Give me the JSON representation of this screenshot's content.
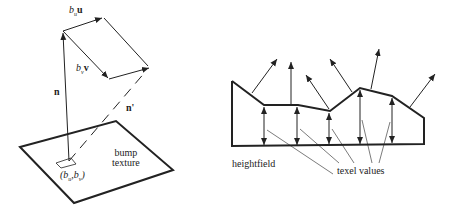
{
  "left_diagram": {
    "labels": {
      "bu_u_prefix": "b",
      "bu_u_sub": "u",
      "bu_u_vec": "u",
      "bv_v_prefix": "b",
      "bv_v_sub": "v",
      "bv_v_vec": "v",
      "normal": "n",
      "perturbed_normal": "n'",
      "bump_line1": "bump",
      "bump_line2": "texture",
      "coord": "(b",
      "coord_sub1": "u",
      "coord_mid": ",b",
      "coord_sub2": "v",
      "coord_end": ")"
    }
  },
  "right_diagram": {
    "labels": {
      "heightfield": "heightfield",
      "texel_values": "texel values"
    }
  },
  "colors": {
    "stroke": "#222222",
    "background": "#ffffff"
  }
}
